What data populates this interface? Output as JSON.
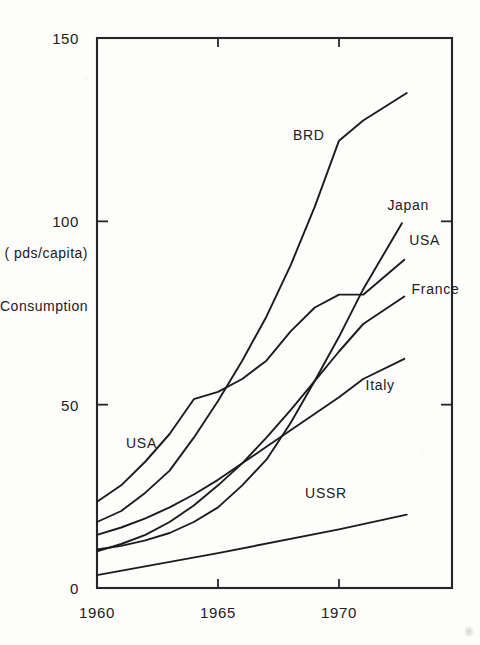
{
  "chart_data": {
    "type": "line",
    "title": "",
    "subtitle": "",
    "xlabel": "",
    "ylabel": "Consumption",
    "ylabel_units": "( pds/capita)",
    "xlim": [
      1960,
      1974.8
    ],
    "ylim": [
      0,
      150
    ],
    "grid": false,
    "legend_position": "inline-labels",
    "x_ticks": [
      {
        "value": 1960,
        "label": "1960"
      },
      {
        "value": 1965,
        "label": "1965"
      },
      {
        "value": 1970,
        "label": "1970"
      }
    ],
    "y_ticks": [
      {
        "value": 0,
        "label": "0"
      },
      {
        "value": 50,
        "label": "50"
      },
      {
        "value": 100,
        "label": "100"
      },
      {
        "value": 150,
        "label": "150"
      }
    ],
    "series": [
      {
        "name": "BRD",
        "label": "BRD",
        "label_x": 1968.1,
        "label_y": 123.5,
        "x": [
          1960,
          1961,
          1962,
          1963,
          1964,
          1965,
          1966,
          1967,
          1968,
          1969,
          1970,
          1971,
          1972.8
        ],
        "y": [
          18.0,
          21.0,
          26.0,
          32.0,
          41.0,
          51.0,
          62.0,
          74.0,
          88.0,
          104.0,
          122.0,
          127.5,
          135.0
        ]
      },
      {
        "name": "Japan",
        "label": "Japan",
        "label_x": 1972.0,
        "label_y": 104.5,
        "x": [
          1960,
          1961,
          1962,
          1963,
          1964,
          1965,
          1966,
          1967,
          1968,
          1969,
          1970,
          1971,
          1972.6
        ],
        "y": [
          10.5,
          11.5,
          13.0,
          15.0,
          18.0,
          22.0,
          28.0,
          35.0,
          45.0,
          56.5,
          68.5,
          81.5,
          99.5
        ]
      },
      {
        "name": "USA",
        "label": "USA",
        "label_x": 1972.9,
        "label_y": 95.0,
        "x": [
          1960,
          1961,
          1962,
          1963,
          1964,
          1965,
          1966,
          1967,
          1968,
          1969,
          1970,
          1971,
          1972.7
        ],
        "y": [
          23.5,
          28.0,
          34.5,
          42.0,
          51.5,
          53.5,
          57.0,
          62.0,
          70.0,
          76.5,
          80.0,
          80.0,
          89.5
        ]
      },
      {
        "name": "France",
        "label": "France",
        "label_x": 1973.0,
        "label_y": 81.5,
        "x": [
          1960,
          1961,
          1962,
          1963,
          1964,
          1965,
          1966,
          1967,
          1968,
          1969,
          1970,
          1971,
          1972.7
        ],
        "y": [
          10.0,
          12.0,
          14.5,
          18.0,
          22.5,
          28.0,
          34.0,
          41.0,
          48.5,
          56.5,
          64.5,
          72.0,
          79.5
        ]
      },
      {
        "name": "Italy",
        "label": "Italy",
        "label_x": 1971.1,
        "label_y": 55.5,
        "x": [
          1960,
          1961,
          1962,
          1963,
          1964,
          1965,
          1966,
          1967,
          1968,
          1969,
          1970,
          1971,
          1972.7
        ],
        "y": [
          14.5,
          16.5,
          19.0,
          22.0,
          25.5,
          29.5,
          34.0,
          38.5,
          43.0,
          47.5,
          52.0,
          57.0,
          62.5
        ]
      },
      {
        "name": "USSR",
        "label": "USSR",
        "label_x": 1968.6,
        "label_y": 26.0,
        "x": [
          1960,
          1965,
          1970,
          1972.8
        ],
        "y": [
          3.5,
          9.5,
          16.0,
          20.0
        ]
      },
      {
        "name": "USA-lower-label",
        "label": "USA",
        "label_x": 1961.2,
        "label_y": 39.5,
        "label_only": true,
        "x": [],
        "y": []
      }
    ],
    "annotations": [
      {
        "text": "Consumption",
        "role": "y-axis-title"
      },
      {
        "text": "( pds/capita)",
        "role": "y-axis-units"
      }
    ]
  },
  "figure": {
    "background_color": "#fdfdfc",
    "ink_color": "#1c1c1c",
    "corner_artifact": "scan-smudge"
  }
}
